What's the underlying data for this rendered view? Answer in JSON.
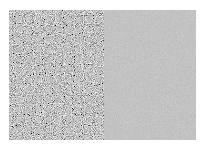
{
  "image": {
    "description": "Two side-by-side grayscale panels: high-contrast random noise on the left, near-uniform mid-gray on the right",
    "background": "#ffffff",
    "panels": [
      {
        "name": "noise",
        "base_color": "#8c8c8c",
        "texture": "high-contrast grayscale noise"
      },
      {
        "name": "flat",
        "base_color": "#8a8a8a",
        "texture": "faint low-contrast noise"
      }
    ]
  }
}
